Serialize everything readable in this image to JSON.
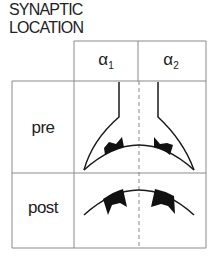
{
  "title": {
    "line1": "SYNAPTIC",
    "line2": "LOCATION"
  },
  "columns": [
    {
      "symbol": "α",
      "subscript": "1"
    },
    {
      "symbol": "α",
      "subscript": "2"
    }
  ],
  "rows": [
    {
      "label": "pre"
    },
    {
      "label": "post"
    }
  ],
  "colors": {
    "line": "#1a1a1a",
    "grid": "#8a8a8a",
    "background": "#ffffff"
  }
}
